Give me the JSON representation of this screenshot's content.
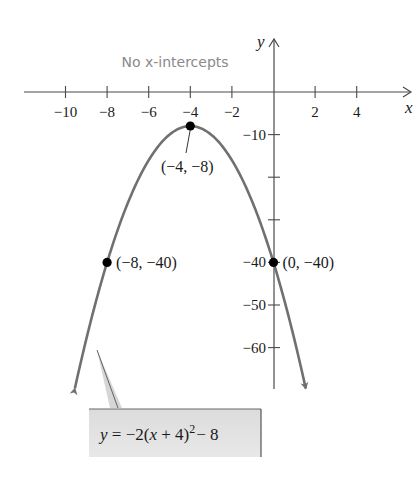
{
  "chart_data": {
    "type": "line",
    "title": "",
    "xlabel": "x",
    "ylabel": "y",
    "equation": "y = −2(x + 4)² − 8",
    "annotation": "No x-intercepts",
    "xlim": [
      -12,
      6.5
    ],
    "ylim": [
      -70,
      15
    ],
    "x_ticks": [
      -10,
      -8,
      -6,
      -4,
      -2,
      2,
      4
    ],
    "x_tick_labels": [
      "−10",
      "−8",
      "−6",
      "−4",
      "−2",
      "2",
      "4"
    ],
    "y_ticks": [
      -10,
      -20,
      -30,
      -40,
      -50,
      -60
    ],
    "y_tick_labels": [
      "−10",
      "",
      "",
      "−40",
      "−50",
      "−60"
    ],
    "grid": false,
    "series": [
      {
        "name": "y = −2(x + 4)² − 8",
        "function": "-2*(x+4)^2-8",
        "x_range": [
          -9.55,
          1.55
        ],
        "color": "#707070",
        "arrows_at_ends": true
      }
    ],
    "points": [
      {
        "x": -4,
        "y": -8,
        "label": "(−4, −8)",
        "role": "vertex"
      },
      {
        "x": -8,
        "y": -40,
        "label": "(−8, −40)",
        "role": "symmetric point"
      },
      {
        "x": 0,
        "y": -40,
        "label": "(0, −40)",
        "role": "y-intercept"
      }
    ]
  },
  "labels": {
    "note": "No x-intercepts",
    "x_axis": "x",
    "y_axis": "y",
    "eq_y": "y",
    "eq_eqsign": " = −2(",
    "eq_x": "x",
    "eq_mid": " + 4)",
    "eq_exp": "2",
    "eq_tail": "− 8"
  },
  "colors": {
    "curve": "#707070",
    "axis": "#4a4a4a",
    "note": "#8a8a8a",
    "callout_fill": "#e4e4e4",
    "point": "#000000"
  }
}
